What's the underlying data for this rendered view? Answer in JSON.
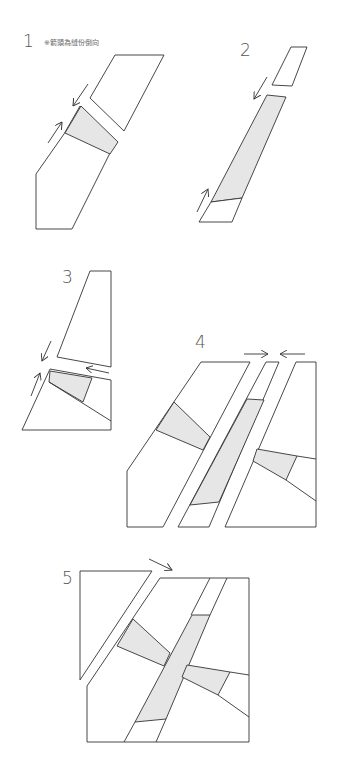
{
  "diagram": {
    "note": "※箭頭為縫份倒向",
    "steps": [
      {
        "label": "1"
      },
      {
        "label": "2"
      },
      {
        "label": "3"
      },
      {
        "label": "4"
      },
      {
        "label": "5"
      }
    ],
    "colors": {
      "shade": "#e6e6e6",
      "line": "#333333",
      "background": "#ffffff"
    }
  }
}
